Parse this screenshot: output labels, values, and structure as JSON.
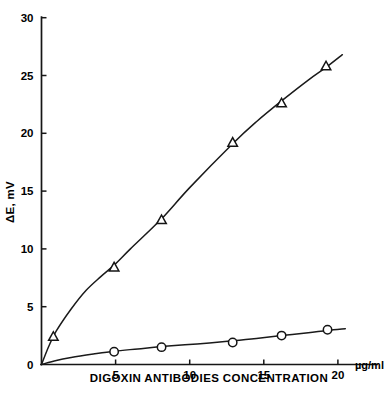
{
  "chart_data": {
    "type": "scatter",
    "title": "",
    "subtitle": "",
    "xlabel": "DIGOXIN ANTIBODIES CONCENTRATION",
    "xunit": "µg/ml",
    "ylabel": "ΔE, mV",
    "xlim": [
      0,
      20.9
    ],
    "ylim": [
      0,
      30.6
    ],
    "xticks": [
      5,
      10,
      15,
      20
    ],
    "xtick_labels": [
      "5",
      "10",
      "15",
      "20"
    ],
    "yticks": [
      0,
      5,
      10,
      15,
      20,
      25,
      30
    ],
    "ytick_labels": [
      "0",
      "5",
      "10",
      "15",
      "20",
      "25",
      "30"
    ],
    "grid": false,
    "legend": "none",
    "series": [
      {
        "name": "upper-curve-triangles",
        "marker": "triangle",
        "points": [
          {
            "x": 0.0,
            "y": 0.0
          },
          {
            "x": 0.8,
            "y": 2.4
          },
          {
            "x": 4.9,
            "y": 8.4
          },
          {
            "x": 8.1,
            "y": 12.5
          },
          {
            "x": 12.9,
            "y": 19.2
          },
          {
            "x": 16.2,
            "y": 22.6
          },
          {
            "x": 19.2,
            "y": 25.8
          }
        ],
        "fit_curve": [
          {
            "x": 0.0,
            "y": 0.0
          },
          {
            "x": 0.5,
            "y": 1.6
          },
          {
            "x": 1.0,
            "y": 2.9
          },
          {
            "x": 2.0,
            "y": 4.8
          },
          {
            "x": 3.0,
            "y": 6.4
          },
          {
            "x": 4.0,
            "y": 7.6
          },
          {
            "x": 4.9,
            "y": 8.6
          },
          {
            "x": 6.0,
            "y": 10.0
          },
          {
            "x": 8.1,
            "y": 12.6
          },
          {
            "x": 10.0,
            "y": 15.3
          },
          {
            "x": 12.9,
            "y": 19.1
          },
          {
            "x": 14.5,
            "y": 21.0
          },
          {
            "x": 16.2,
            "y": 22.8
          },
          {
            "x": 18.0,
            "y": 24.6
          },
          {
            "x": 19.2,
            "y": 25.7
          },
          {
            "x": 20.3,
            "y": 26.8
          }
        ]
      },
      {
        "name": "lower-curve-circles",
        "marker": "circle",
        "points": [
          {
            "x": 0.0,
            "y": 0.0
          },
          {
            "x": 4.9,
            "y": 1.1
          },
          {
            "x": 8.1,
            "y": 1.5
          },
          {
            "x": 12.9,
            "y": 1.9
          },
          {
            "x": 16.2,
            "y": 2.5
          },
          {
            "x": 19.3,
            "y": 3.0
          }
        ],
        "fit_curve": [
          {
            "x": 0.0,
            "y": 0.0
          },
          {
            "x": 1.0,
            "y": 0.35
          },
          {
            "x": 2.0,
            "y": 0.6
          },
          {
            "x": 3.5,
            "y": 0.9
          },
          {
            "x": 4.9,
            "y": 1.15
          },
          {
            "x": 6.5,
            "y": 1.35
          },
          {
            "x": 8.1,
            "y": 1.55
          },
          {
            "x": 10.5,
            "y": 1.78
          },
          {
            "x": 12.9,
            "y": 2.05
          },
          {
            "x": 14.5,
            "y": 2.25
          },
          {
            "x": 16.2,
            "y": 2.5
          },
          {
            "x": 18.0,
            "y": 2.75
          },
          {
            "x": 19.3,
            "y": 2.95
          },
          {
            "x": 20.5,
            "y": 3.1
          }
        ]
      }
    ],
    "colors": {
      "axis": "#161616",
      "curve": "#1a1a1a",
      "marker_fill": "#ffffff",
      "marker_stroke": "#141414",
      "background": "#ffffff",
      "text": "#000000"
    }
  }
}
